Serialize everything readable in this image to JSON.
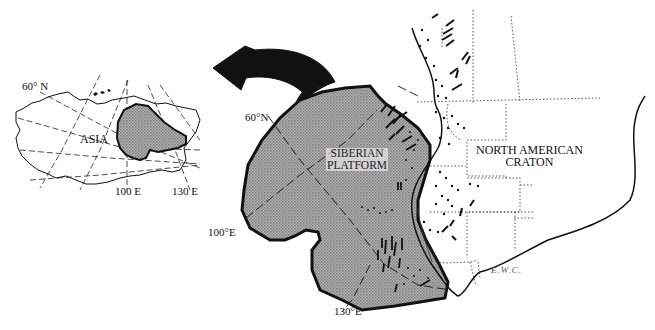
{
  "figure": {
    "type": "reconstruction map",
    "arrow": {
      "direction": "counter-clockwise rotation toward inset"
    },
    "inset": {
      "region_label": "ASIA",
      "lat_label": "60° N",
      "lon_labels": [
        "100 E",
        "130 E"
      ]
    },
    "main": {
      "platform_label_line1": "SIBERIAN",
      "platform_label_line2": "PLATFORM",
      "craton_label_line1": "NORTH AMERICAN",
      "craton_label_line2": "CRATON",
      "lat_label": "60°N",
      "lon_label_100": "100°E",
      "lon_label_130": "130°E",
      "signature": "E.W.C."
    },
    "colors": {
      "platform_fill": "#9a9a9a",
      "outline": "#111111",
      "background": "#ffffff"
    }
  }
}
